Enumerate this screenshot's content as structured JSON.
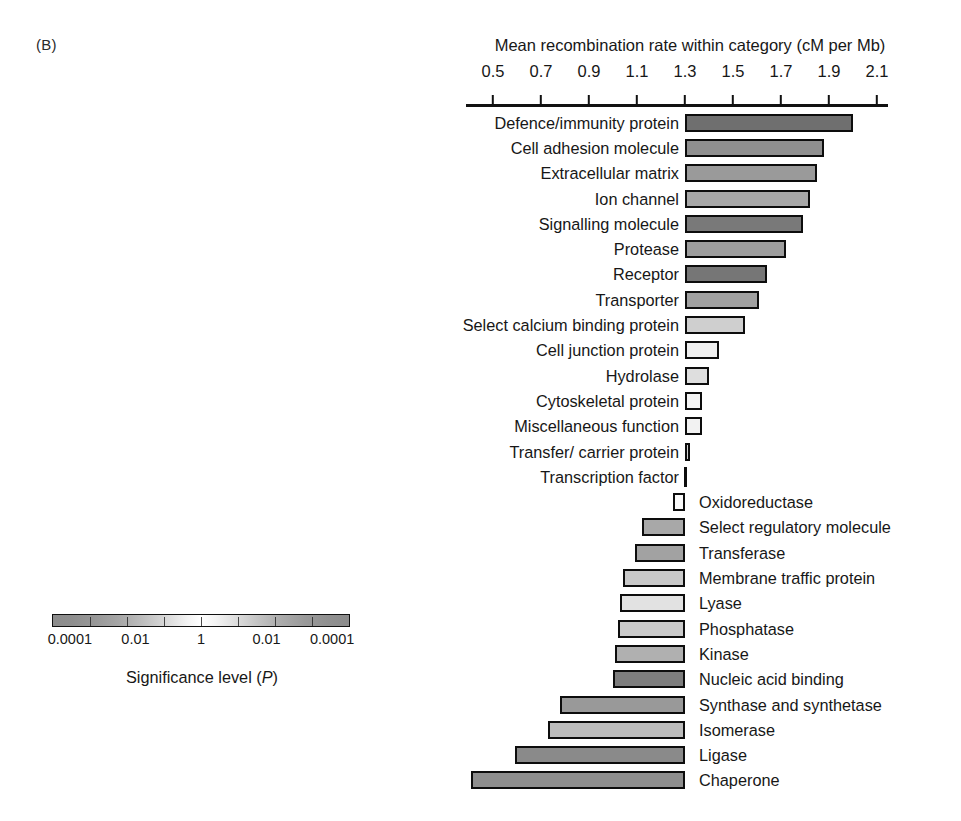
{
  "panel": {
    "letter": "(B)"
  },
  "axis": {
    "title": "Mean recombination rate within category (cM per Mb)",
    "ticks": [
      0.5,
      0.7,
      0.9,
      1.1,
      1.3,
      1.5,
      1.7,
      1.9,
      2.1
    ],
    "tick_labels": [
      "0.5",
      "0.7",
      "0.9",
      "1.1",
      "1.3",
      "1.5",
      "1.7",
      "1.9",
      "2.1"
    ],
    "min": 0.43,
    "max": 2.18,
    "baseline": 1.3
  },
  "legend": {
    "caption_main": "Significance level (",
    "caption_italic": "P",
    "caption_end": ")",
    "caption_full": "Significance level (P)",
    "labels": [
      "0.0001",
      "0.01",
      "1",
      "0.01",
      "0.0001"
    ],
    "label_positions": [
      0.06,
      0.28,
      0.5,
      0.72,
      0.94
    ],
    "low_color": "#8c8c8c",
    "mid_color": "#ffffff",
    "high_color": "#8b8b8b"
  },
  "chart_data": {
    "type": "bar",
    "title": "Mean recombination rate within category (cM per Mb)",
    "xlabel": "Mean recombination rate within category (cM per Mb)",
    "ylabel": "",
    "xlim": [
      0.43,
      2.18
    ],
    "grid": false,
    "orientation": "horizontal",
    "baseline": 1.3,
    "legend": "Significance level (P)",
    "categories": [
      "Defence/immunity protein",
      "Cell adhesion molecule",
      "Extracellular matrix",
      "Ion channel",
      "Signalling molecule",
      "Protease",
      "Receptor",
      "Transporter",
      "Select calcium binding protein",
      "Cell junction protein",
      "Hydrolase",
      "Cytoskeletal protein",
      "Miscellaneous function",
      "Transfer/ carrier protein",
      "Transcription factor",
      "Oxidoreductase",
      "Select regulatory molecule",
      "Transferase",
      "Membrane traffic protein",
      "Lyase",
      "Phosphatase",
      "Kinase",
      "Nucleic acid binding",
      "Synthase and synthetase",
      "Isomerase",
      "Ligase",
      "Chaperone"
    ],
    "values": [
      2.0,
      1.88,
      1.85,
      1.82,
      1.79,
      1.72,
      1.64,
      1.61,
      1.55,
      1.44,
      1.4,
      1.37,
      1.37,
      1.32,
      1.3,
      1.25,
      1.12,
      1.09,
      1.04,
      1.03,
      1.02,
      1.01,
      1.0,
      0.78,
      0.73,
      0.59,
      0.41
    ],
    "label_side": [
      "left",
      "left",
      "left",
      "left",
      "left",
      "left",
      "left",
      "left",
      "left",
      "left",
      "left",
      "left",
      "left",
      "left",
      "left",
      "right",
      "right",
      "right",
      "right",
      "right",
      "right",
      "right",
      "right",
      "right",
      "right",
      "right",
      "right"
    ],
    "fill_shades": [
      "#6f6f6f",
      "#8f8f8f",
      "#9a9a9a",
      "#a7a7a7",
      "#797979",
      "#9d9d9d",
      "#767676",
      "#a0a0a0",
      "#cfcfcf",
      "#efefef",
      "#dedede",
      "#f4f4f4",
      "#f2f2f2",
      "#d2d2d2",
      "#ffffff",
      "#fafafa",
      "#a8a8a8",
      "#a2a2a2",
      "#c9c9c9",
      "#e2e2e2",
      "#cacaca",
      "#b0b0b0",
      "#7d7d7d",
      "#999999",
      "#bcbcbc",
      "#8a8a8a",
      "#8e8e8e"
    ]
  }
}
